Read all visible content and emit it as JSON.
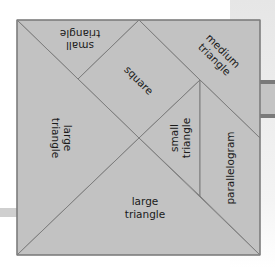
{
  "diagram": {
    "type": "tangram",
    "colors": {
      "fill": "#c2c2c2",
      "stroke": "#7d7d7d",
      "text": "#1a1a1a"
    },
    "pieces": [
      {
        "id": "top-small-triangle",
        "label_lines": [
          "small",
          "triangle"
        ]
      },
      {
        "id": "square",
        "label_lines": [
          "square"
        ]
      },
      {
        "id": "medium-triangle",
        "label_lines": [
          "medium",
          "triangle"
        ]
      },
      {
        "id": "left-large-triangle",
        "label_lines": [
          "large",
          "triangle"
        ]
      },
      {
        "id": "middle-small-triangle",
        "label_lines": [
          "small",
          "triangle"
        ]
      },
      {
        "id": "parallelogram",
        "label_lines": [
          "parallelogram"
        ]
      },
      {
        "id": "bottom-large-triangle",
        "label_lines": [
          "large",
          "triangle"
        ]
      }
    ]
  }
}
